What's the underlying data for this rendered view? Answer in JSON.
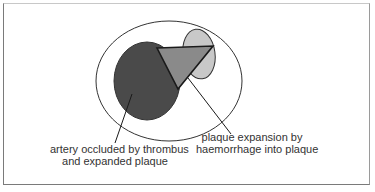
{
  "diagram": {
    "type": "artery cross-section schematic",
    "colors": {
      "frame_border": "#7a7a7a",
      "outline": "#222222",
      "thrombus_fill": "#4a4a4a",
      "plaque_fill": "#8a8a8a",
      "haemorrhage_fill": "#c8c8c8",
      "background": "#ffffff",
      "text": "#333333"
    },
    "shapes": {
      "artery_wall": {
        "cx": 169,
        "cy": 81,
        "rx": 73,
        "ry": 60
      },
      "occluded_lumen": {
        "cx": 147,
        "cy": 81,
        "rx": 33,
        "ry": 39
      },
      "haemorrhage": {
        "cx": 199,
        "cy": 54,
        "rx": 16,
        "ry": 25
      },
      "plaque_triangle": {
        "points": "157,48 213,46 178,89"
      },
      "leader_left": {
        "x1": 132,
        "y1": 94,
        "x2": 115,
        "y2": 143
      },
      "leader_right": {
        "x1": 188,
        "y1": 78,
        "x2": 231,
        "y2": 134
      }
    },
    "labels": {
      "occlusion": {
        "line1": "artery occluded by thrombus",
        "line2": "and expanded plaque"
      },
      "expansion": {
        "line1": "plaque expansion by",
        "line2": "haemorrhage into plaque"
      }
    }
  }
}
